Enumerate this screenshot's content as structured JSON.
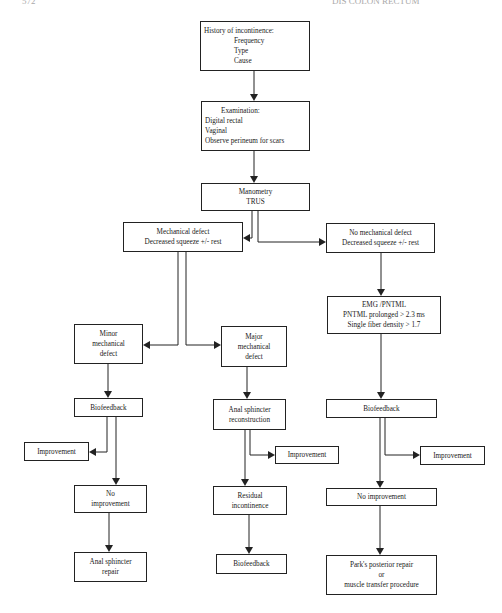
{
  "page_header": {
    "left": "572",
    "right": "DIS COLON RECTUM"
  },
  "flowchart": {
    "history": {
      "title": "History of incontinence:",
      "items": [
        "Frequency",
        "Type",
        "Cause"
      ]
    },
    "examination": {
      "title": "Examination:",
      "items": [
        "Digital rectal",
        "Vaginal",
        "Observe perineum for scars"
      ]
    },
    "manometry": {
      "lines": [
        "Manometry",
        "TRUS"
      ]
    },
    "mechanical_defect": {
      "lines": [
        "Mechanical defect",
        "Decreased squeeze +/- rest"
      ]
    },
    "no_mechanical_defect": {
      "lines": [
        "No mechanical defect",
        "Decreased squeeze +/- rest"
      ]
    },
    "emg": {
      "lines": [
        "EMG /PNTML",
        "PNTML prolonged > 2.3 ms",
        "Single fiber density > 1.7"
      ]
    },
    "minor_defect": {
      "lines": [
        "Minor",
        "mechanical",
        "defect"
      ]
    },
    "major_defect": {
      "lines": [
        "Major",
        "mechanical",
        "defect"
      ]
    },
    "biofeedback_left": {
      "label": "Biofeedback"
    },
    "sphincter_reconstruction": {
      "lines": [
        "Anal sphincter",
        "reconstruction"
      ]
    },
    "biofeedback_right": {
      "label": "Biofeedback"
    },
    "improvement_left": {
      "label": "Improvement"
    },
    "improvement_middle": {
      "label": "Improvement"
    },
    "improvement_right": {
      "label": "Improvement"
    },
    "no_improvement_left": {
      "lines": [
        "No",
        "improvement"
      ]
    },
    "residual_incontinence": {
      "lines": [
        "Residual",
        "incontinence"
      ]
    },
    "no_improvement_right": {
      "label": "No improvement"
    },
    "sphincter_repair": {
      "lines": [
        "Anal sphincter",
        "repair"
      ]
    },
    "biofeedback_middle": {
      "label": "Biofeedback"
    },
    "parks_repair": {
      "lines": [
        "Park's posterior repair",
        "or",
        "muscle transfer procedure"
      ]
    }
  }
}
